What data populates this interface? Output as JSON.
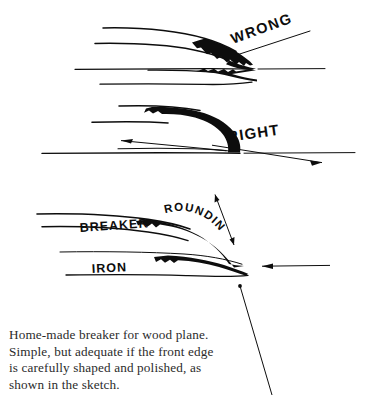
{
  "figure": {
    "kind": "technical-line-illustration",
    "background_color": "#ffffff",
    "ink_color": "#000000",
    "panels": [
      {
        "id": "wrong",
        "label": "WRONG",
        "label_rotation_deg": -20,
        "description": "Breaker with an abrupt, hooked front edge that stops short of the iron; shavings jam."
      },
      {
        "id": "right",
        "label": "RIGHT",
        "label_rotation_deg": -8,
        "description": "Breaker with a long sweeping curve meeting the iron flush at the cutting edge."
      },
      {
        "id": "detail",
        "label": "",
        "description": "Exploded detail naming the two parts and the rounded front edge.",
        "callouts": [
          {
            "id": "rounding",
            "label": "ROUNDING",
            "style": "curved"
          },
          {
            "id": "breaker",
            "label": "BREAKER",
            "style": "straight"
          },
          {
            "id": "iron",
            "label": "IRON",
            "style": "straight"
          }
        ]
      }
    ]
  },
  "caption": {
    "text": "Home-made breaker for wood plane.\nSimple, but adequate if the front edge\nis carefully shaped and polished, as\nshown in the sketch."
  }
}
